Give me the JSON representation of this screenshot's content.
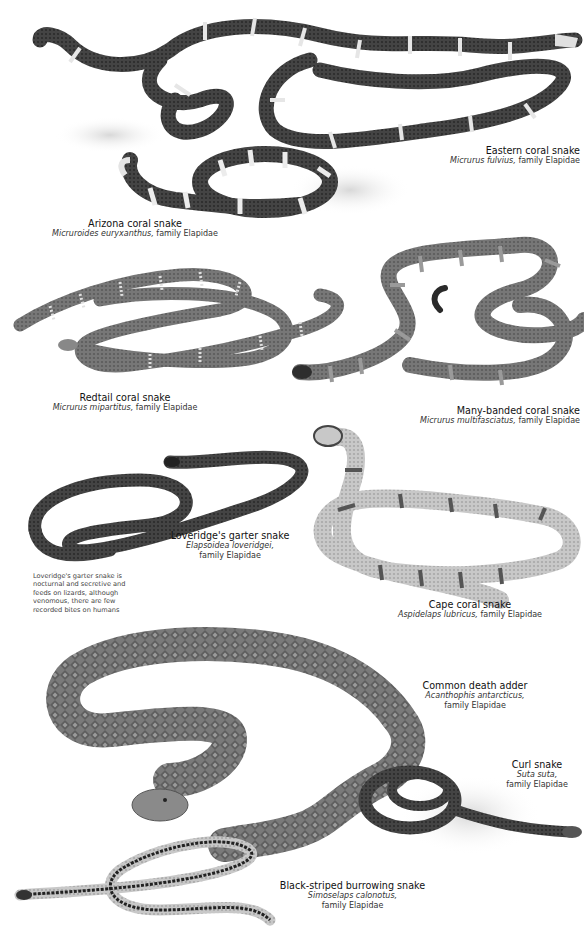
{
  "page": {
    "family": "Elapidae",
    "species": [
      {
        "id": "eastern-coral-snake",
        "common_name": "Eastern coral snake",
        "scientific_name": "Micrurus fulvius,",
        "family_label": "family Elapidae"
      },
      {
        "id": "arizona-coral-snake",
        "common_name": "Arizona coral snake",
        "scientific_name": "Micruroides euryxanthus,",
        "family_label": "family Elapidae"
      },
      {
        "id": "redtail-coral-snake",
        "common_name": "Redtail coral snake",
        "scientific_name": "Micrurus mipartitus,",
        "family_label": "family Elapidae"
      },
      {
        "id": "many-banded-coral-snake",
        "common_name": "Many-banded coral snake",
        "scientific_name": "Micrurus multifasciatus,",
        "family_label": "family Elapidae"
      },
      {
        "id": "loveridges-garter-snake",
        "common_name": "Loveridge's garter snake",
        "scientific_name": "Elapsoidea loveridgei,",
        "family_label": "family Elapidae"
      },
      {
        "id": "cape-coral-snake",
        "common_name": "Cape coral snake",
        "scientific_name": "Aspidelaps lubricus,",
        "family_label": "family Elapidae"
      },
      {
        "id": "common-death-adder",
        "common_name": "Common death adder",
        "scientific_name": "Acanthophis antarcticus,",
        "family_label": "family Elapidae"
      },
      {
        "id": "curl-snake",
        "common_name": "Curl snake",
        "scientific_name": "Suta suta,",
        "family_label": "family Elapidae"
      },
      {
        "id": "black-striped-burrowing-snake",
        "common_name": "Black-striped burrowing snake",
        "scientific_name": "Simoselaps calonotus,",
        "family_label": "family Elapidae"
      }
    ],
    "note": "Loveridge's garter snake is nocturnal and secretive and feeds on lizards, although venomous, there are few recorded bites on humans"
  },
  "colors": {
    "background": "#ffffff",
    "snake_dark": "#3a3a3a",
    "snake_mid": "#6e6e6e",
    "snake_light": "#bdbdbd",
    "band_light": "#e4e4e4",
    "text": "#1a1a1a"
  }
}
